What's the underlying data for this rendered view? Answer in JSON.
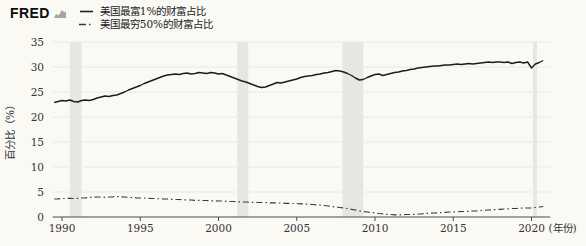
{
  "header": {
    "logo_text": "FRED",
    "legend": [
      {
        "label": "美国最富1%的财富占比",
        "style": "solid"
      },
      {
        "label": "美国最穷50%的财富占比",
        "style": "dashdot"
      }
    ]
  },
  "chart_data": {
    "type": "line",
    "title": "",
    "ylabel": "百分比（%）",
    "x_unit_label": "(年份)",
    "x_ticks": [
      1990,
      1995,
      2000,
      2005,
      2010,
      2015,
      2020
    ],
    "y_ticks": [
      0,
      5,
      10,
      15,
      20,
      25,
      30,
      35
    ],
    "xlim": [
      1989.4,
      2021.2
    ],
    "ylim": [
      0,
      35
    ],
    "grid": "horizontal",
    "legend_position": "top-left",
    "recession_bands": [
      [
        1990.5,
        1991.25
      ],
      [
        2001.2,
        2001.9
      ],
      [
        2007.92,
        2009.25
      ],
      [
        2020.1,
        2020.35
      ]
    ],
    "series": [
      {
        "name": "美国最富1%的财富占比",
        "style": "solid",
        "color": "#1c1c1c",
        "x_start": 1989.5,
        "x_step": 0.25,
        "values": [
          22.9,
          23.1,
          23.3,
          23.2,
          23.4,
          23.1,
          23.0,
          23.3,
          23.4,
          23.3,
          23.5,
          23.8,
          24.0,
          24.2,
          24.1,
          24.3,
          24.4,
          24.7,
          25.0,
          25.4,
          25.7,
          26.0,
          26.3,
          26.7,
          27.0,
          27.3,
          27.6,
          27.9,
          28.2,
          28.4,
          28.5,
          28.6,
          28.5,
          28.7,
          28.8,
          28.6,
          28.7,
          28.9,
          28.8,
          28.7,
          28.9,
          28.8,
          28.6,
          28.7,
          28.4,
          28.1,
          27.8,
          27.5,
          27.2,
          27.0,
          26.7,
          26.4,
          26.1,
          25.9,
          26.0,
          26.3,
          26.6,
          26.9,
          26.8,
          27.0,
          27.2,
          27.4,
          27.6,
          27.9,
          28.1,
          28.2,
          28.3,
          28.5,
          28.6,
          28.8,
          28.9,
          29.1,
          29.3,
          29.2,
          29.0,
          28.7,
          28.3,
          27.8,
          27.4,
          27.5,
          27.9,
          28.2,
          28.5,
          28.6,
          28.3,
          28.5,
          28.7,
          28.9,
          29.0,
          29.2,
          29.3,
          29.5,
          29.6,
          29.8,
          29.9,
          30.0,
          30.1,
          30.2,
          30.2,
          30.3,
          30.4,
          30.4,
          30.5,
          30.6,
          30.5,
          30.6,
          30.7,
          30.6,
          30.7,
          30.8,
          30.9,
          31.0,
          30.9,
          31.0,
          31.0,
          30.9,
          31.0,
          30.7,
          30.9,
          31.0,
          30.8,
          31.0,
          29.8,
          30.6,
          30.9,
          31.3
        ]
      },
      {
        "name": "美国最穷50%的财富占比",
        "style": "dashdot",
        "color": "#3a3a3a",
        "x_start": 1989.5,
        "x_step": 0.25,
        "values": [
          3.6,
          3.65,
          3.7,
          3.7,
          3.75,
          3.7,
          3.75,
          3.8,
          3.85,
          3.9,
          3.95,
          4.0,
          4.0,
          3.95,
          4.0,
          4.05,
          4.1,
          4.05,
          4.0,
          3.95,
          3.9,
          3.85,
          3.8,
          3.8,
          3.75,
          3.7,
          3.7,
          3.65,
          3.6,
          3.6,
          3.55,
          3.5,
          3.5,
          3.45,
          3.4,
          3.4,
          3.35,
          3.35,
          3.3,
          3.3,
          3.25,
          3.25,
          3.2,
          3.2,
          3.15,
          3.1,
          3.1,
          3.05,
          3.0,
          3.0,
          2.95,
          2.95,
          2.9,
          2.9,
          2.9,
          2.85,
          2.85,
          2.8,
          2.8,
          2.75,
          2.75,
          2.7,
          2.7,
          2.65,
          2.6,
          2.55,
          2.5,
          2.45,
          2.4,
          2.3,
          2.2,
          2.1,
          2.0,
          1.9,
          1.8,
          1.7,
          1.55,
          1.4,
          1.25,
          1.1,
          1.0,
          0.9,
          0.8,
          0.7,
          0.65,
          0.55,
          0.5,
          0.45,
          0.4,
          0.45,
          0.5,
          0.5,
          0.55,
          0.6,
          0.65,
          0.7,
          0.75,
          0.8,
          0.85,
          0.9,
          0.95,
          1.0,
          1.0,
          1.05,
          1.1,
          1.1,
          1.15,
          1.2,
          1.25,
          1.3,
          1.35,
          1.4,
          1.45,
          1.5,
          1.55,
          1.6,
          1.65,
          1.7,
          1.7,
          1.75,
          1.8,
          1.8,
          1.8,
          1.9,
          2.0,
          2.1
        ]
      }
    ],
    "colors": {
      "background": "#fbf9f4",
      "grid": "#eae8e2",
      "recession_band": "#e7e6e1",
      "axis": "#4a4a4a",
      "text": "#333333"
    }
  }
}
